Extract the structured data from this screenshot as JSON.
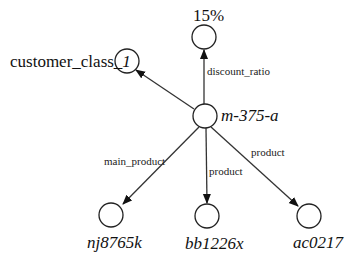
{
  "diagram": {
    "type": "directed-graph",
    "center_node": {
      "id": "center",
      "label": "m-375-a"
    },
    "nodes": [
      {
        "id": "center",
        "label": "m-375-a"
      },
      {
        "id": "customer_class",
        "label_prefix": "customer_class_",
        "label_suffix": "1"
      },
      {
        "id": "discount",
        "label": "15%"
      },
      {
        "id": "n1",
        "label": "nj8765k"
      },
      {
        "id": "n2",
        "label": "bb1226x"
      },
      {
        "id": "n3",
        "label": "ac0217"
      }
    ],
    "edges": [
      {
        "from": "center",
        "to": "customer_class",
        "label": ""
      },
      {
        "from": "center",
        "to": "discount",
        "label": "discount_ratio"
      },
      {
        "from": "center",
        "to": "n1",
        "label": "main_product"
      },
      {
        "from": "center",
        "to": "n2",
        "label": "product"
      },
      {
        "from": "center",
        "to": "n3",
        "label": "product"
      }
    ],
    "colors": {
      "stroke": "#222222",
      "background": "#ffffff"
    },
    "cut_caption": "(cropped text line at bottom edge)"
  }
}
